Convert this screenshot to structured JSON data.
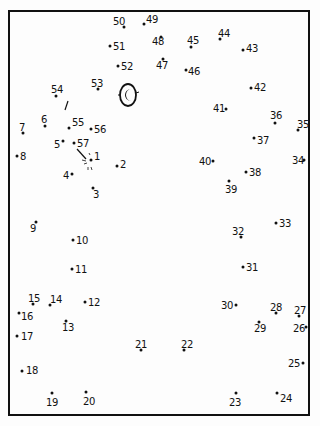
{
  "puzzle": {
    "type": "connect-the-dots",
    "frame_color": "#111111",
    "dots": [
      {
        "n": "1",
        "x": 91,
        "y": 160,
        "lx": 94,
        "ly": 152
      },
      {
        "n": "2",
        "x": 117,
        "y": 166,
        "lx": 120,
        "ly": 160
      },
      {
        "n": "3",
        "x": 93,
        "y": 188,
        "lx": 93,
        "ly": 190
      },
      {
        "n": "4",
        "x": 72,
        "y": 174,
        "lx": 63,
        "ly": 171
      },
      {
        "n": "5",
        "x": 63,
        "y": 141,
        "lx": 54,
        "ly": 140
      },
      {
        "n": "6",
        "x": 45,
        "y": 126,
        "lx": 41,
        "ly": 115
      },
      {
        "n": "7",
        "x": 23,
        "y": 133,
        "lx": 19,
        "ly": 123
      },
      {
        "n": "8",
        "x": 17,
        "y": 156,
        "lx": 20,
        "ly": 152
      },
      {
        "n": "9",
        "x": 36,
        "y": 222,
        "lx": 30,
        "ly": 224
      },
      {
        "n": "10",
        "x": 73,
        "y": 240,
        "lx": 76,
        "ly": 236
      },
      {
        "n": "11",
        "x": 72,
        "y": 269,
        "lx": 75,
        "ly": 265
      },
      {
        "n": "12",
        "x": 85,
        "y": 302,
        "lx": 88,
        "ly": 298
      },
      {
        "n": "13",
        "x": 66,
        "y": 321,
        "lx": 62,
        "ly": 323
      },
      {
        "n": "14",
        "x": 50,
        "y": 305,
        "lx": 50,
        "ly": 295
      },
      {
        "n": "15",
        "x": 33,
        "y": 304,
        "lx": 28,
        "ly": 294
      },
      {
        "n": "16",
        "x": 19,
        "y": 313,
        "lx": 21,
        "ly": 312
      },
      {
        "n": "17",
        "x": 17,
        "y": 336,
        "lx": 21,
        "ly": 332
      },
      {
        "n": "18",
        "x": 22,
        "y": 371,
        "lx": 26,
        "ly": 366
      },
      {
        "n": "19",
        "x": 52,
        "y": 393,
        "lx": 46,
        "ly": 398
      },
      {
        "n": "20",
        "x": 86,
        "y": 392,
        "lx": 83,
        "ly": 397
      },
      {
        "n": "21",
        "x": 141,
        "y": 350,
        "lx": 135,
        "ly": 340
      },
      {
        "n": "22",
        "x": 184,
        "y": 350,
        "lx": 181,
        "ly": 340
      },
      {
        "n": "23",
        "x": 236,
        "y": 393,
        "lx": 229,
        "ly": 398
      },
      {
        "n": "24",
        "x": 277,
        "y": 393,
        "lx": 280,
        "ly": 394
      },
      {
        "n": "25",
        "x": 303,
        "y": 363,
        "lx": 288,
        "ly": 359
      },
      {
        "n": "26",
        "x": 306,
        "y": 327,
        "lx": 293,
        "ly": 324
      },
      {
        "n": "27",
        "x": 299,
        "y": 316,
        "lx": 294,
        "ly": 306
      },
      {
        "n": "28",
        "x": 276,
        "y": 313,
        "lx": 270,
        "ly": 303
      },
      {
        "n": "29",
        "x": 259,
        "y": 322,
        "lx": 254,
        "ly": 324
      },
      {
        "n": "30",
        "x": 236,
        "y": 305,
        "lx": 221,
        "ly": 301
      },
      {
        "n": "31",
        "x": 243,
        "y": 267,
        "lx": 246,
        "ly": 263
      },
      {
        "n": "32",
        "x": 241,
        "y": 237,
        "lx": 232,
        "ly": 227
      },
      {
        "n": "33",
        "x": 276,
        "y": 223,
        "lx": 279,
        "ly": 219
      },
      {
        "n": "34",
        "x": 304,
        "y": 160,
        "lx": 292,
        "ly": 156
      },
      {
        "n": "35",
        "x": 298,
        "y": 130,
        "lx": 297,
        "ly": 120
      },
      {
        "n": "36",
        "x": 275,
        "y": 123,
        "lx": 270,
        "ly": 111
      },
      {
        "n": "37",
        "x": 254,
        "y": 138,
        "lx": 257,
        "ly": 136
      },
      {
        "n": "38",
        "x": 246,
        "y": 172,
        "lx": 249,
        "ly": 168
      },
      {
        "n": "39",
        "x": 229,
        "y": 181,
        "lx": 225,
        "ly": 185
      },
      {
        "n": "40",
        "x": 213,
        "y": 161,
        "lx": 199,
        "ly": 157
      },
      {
        "n": "41",
        "x": 226,
        "y": 109,
        "lx": 213,
        "ly": 104
      },
      {
        "n": "42",
        "x": 251,
        "y": 88,
        "lx": 254,
        "ly": 83
      },
      {
        "n": "43",
        "x": 243,
        "y": 50,
        "lx": 246,
        "ly": 44
      },
      {
        "n": "44",
        "x": 220,
        "y": 39,
        "lx": 218,
        "ly": 29
      },
      {
        "n": "45",
        "x": 191,
        "y": 47,
        "lx": 187,
        "ly": 36
      },
      {
        "n": "46",
        "x": 186,
        "y": 70,
        "lx": 188,
        "ly": 67
      },
      {
        "n": "47",
        "x": 163,
        "y": 59,
        "lx": 156,
        "ly": 61
      },
      {
        "n": "48",
        "x": 161,
        "y": 37,
        "lx": 152,
        "ly": 37
      },
      {
        "n": "49",
        "x": 144,
        "y": 24,
        "lx": 146,
        "ly": 15
      },
      {
        "n": "50",
        "x": 124,
        "y": 27,
        "lx": 113,
        "ly": 17
      },
      {
        "n": "51",
        "x": 110,
        "y": 46,
        "lx": 113,
        "ly": 42
      },
      {
        "n": "52",
        "x": 118,
        "y": 66,
        "lx": 121,
        "ly": 62
      },
      {
        "n": "53",
        "x": 98,
        "y": 89,
        "lx": 91,
        "ly": 79
      },
      {
        "n": "54",
        "x": 56,
        "y": 96,
        "lx": 51,
        "ly": 85
      },
      {
        "n": "55",
        "x": 69,
        "y": 128,
        "lx": 72,
        "ly": 118
      },
      {
        "n": "56",
        "x": 91,
        "y": 129,
        "lx": 94,
        "ly": 125
      },
      {
        "n": "57",
        "x": 74,
        "y": 143,
        "lx": 77,
        "ly": 139
      }
    ],
    "pre_drawn": {
      "eye": {
        "cx": 128,
        "cy": 95,
        "rx": 8,
        "ry": 11,
        "pupil": "crescent"
      },
      "stroke_near_54": {
        "x1": 68,
        "y1": 101,
        "x2": 65,
        "y2": 110
      },
      "stroke_near_57": {
        "x1": 77,
        "y1": 149,
        "x2": 86,
        "y2": 159
      }
    }
  }
}
